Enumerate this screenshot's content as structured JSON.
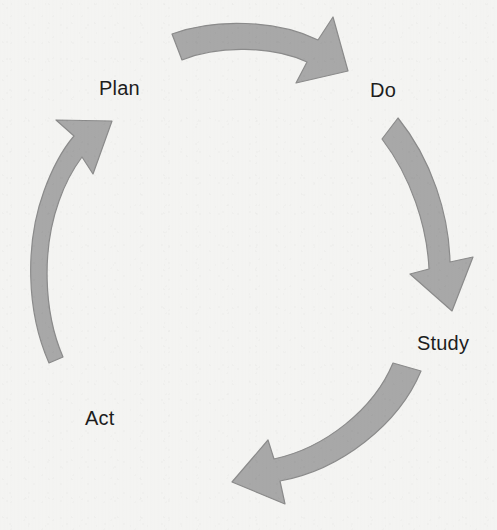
{
  "diagram": {
    "name": "PDSA Cycle",
    "type": "cycle-diagram",
    "direction": "clockwise",
    "background_color": "#f4f4f2",
    "arrow_fill_color": "#a8a8a8",
    "arrow_edge_color": "#8e8e8e",
    "label_color": "#1d1d1d",
    "stages": [
      {
        "id": "plan",
        "label": "Plan",
        "position": "top-left",
        "label_x": 99,
        "label_y": 78
      },
      {
        "id": "do",
        "label": "Do",
        "position": "top-right",
        "label_x": 370,
        "label_y": 80
      },
      {
        "id": "study",
        "label": "Study",
        "position": "bottom-right",
        "label_x": 417,
        "label_y": 333
      },
      {
        "id": "act",
        "label": "Act",
        "position": "bottom-left",
        "label_x": 85,
        "label_y": 408
      }
    ],
    "arrows": [
      {
        "id": "plan-to-do",
        "from": "plan",
        "to": "do",
        "position": "top",
        "points_toward": "right"
      },
      {
        "id": "do-to-study",
        "from": "do",
        "to": "study",
        "position": "right",
        "points_toward": "down"
      },
      {
        "id": "study-to-act",
        "from": "study",
        "to": "act",
        "position": "bottom",
        "points_toward": "left"
      },
      {
        "id": "act-to-plan",
        "from": "act",
        "to": "plan",
        "position": "left",
        "points_toward": "up"
      }
    ]
  }
}
